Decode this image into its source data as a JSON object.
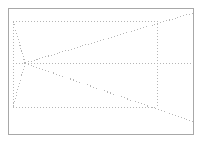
{
  "canvas": {
    "width": 204,
    "height": 142,
    "background_color": "#ffffff",
    "title": "Perspective wireframe diagram"
  },
  "frame": {
    "name": "outer-border",
    "x": 8,
    "y": 8,
    "width": 186,
    "height": 127,
    "stroke_color": "#a8a8a8",
    "stroke_width": 1,
    "style": "solid"
  },
  "style": {
    "dot_color": "#b5b5b5",
    "dot_width": 1,
    "dash_pattern": "1 2"
  },
  "vanishing_point": {
    "name": "vanishing-point",
    "x": 25,
    "y": 63,
    "label": "VP"
  },
  "front_rectangle": {
    "name": "front-face-rectangle",
    "left": 13,
    "top": 21,
    "right": 157,
    "bottom": 107,
    "corners": [
      {
        "name": "top-left",
        "x": 13,
        "y": 21
      },
      {
        "name": "top-right",
        "x": 157,
        "y": 21
      },
      {
        "name": "bottom-right",
        "x": 157,
        "y": 107
      },
      {
        "name": "bottom-left",
        "x": 13,
        "y": 107
      }
    ]
  },
  "edges": [
    {
      "name": "rect-top-edge",
      "x1": 13,
      "y1": 21,
      "x2": 157,
      "y2": 21
    },
    {
      "name": "rect-bottom-edge",
      "x1": 13,
      "y1": 107,
      "x2": 157,
      "y2": 107
    },
    {
      "name": "rect-left-edge",
      "x1": 13,
      "y1": 21,
      "x2": 13,
      "y2": 107
    },
    {
      "name": "rect-right-edge",
      "x1": 157,
      "y1": 21,
      "x2": 157,
      "y2": 107
    }
  ],
  "perspective_rays": [
    {
      "name": "ray-horizon",
      "x1": 13,
      "y1": 63,
      "x2": 193,
      "y2": 63
    },
    {
      "name": "ray-upper-left",
      "x1": 25,
      "y1": 63,
      "x2": 13,
      "y2": 21
    },
    {
      "name": "ray-lower-left",
      "x1": 25,
      "y1": 63,
      "x2": 13,
      "y2": 107
    },
    {
      "name": "ray-upper-right",
      "x1": 25,
      "y1": 63,
      "x2": 193,
      "y2": 13
    },
    {
      "name": "ray-lower-right",
      "x1": 25,
      "y1": 63,
      "x2": 193,
      "y2": 122
    }
  ]
}
